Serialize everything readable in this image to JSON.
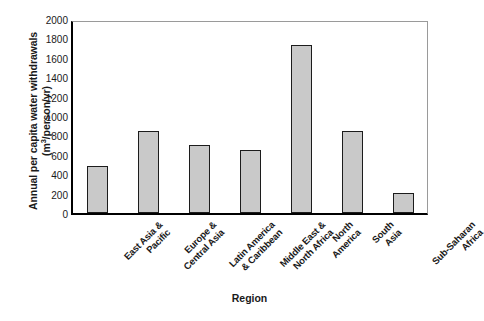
{
  "chart_data": {
    "type": "bar",
    "title": "",
    "xlabel": "Region",
    "ylabel": "Annual per capita water withdrawals (m³/person/yr)",
    "ylabel_line1": "Annual per capita water withdrawals",
    "ylabel_line2_prefix": "(m",
    "ylabel_line2_sup": "3",
    "ylabel_line2_suffix": "/person/yr)",
    "categories": [
      "East Asia & Pacific",
      "Europe & Central Asia",
      "Latin America & Caribbean",
      "Middle East & North Africa",
      "North America",
      "South Asia",
      "Sub-Saharan Africa"
    ],
    "category_lines": [
      [
        "East Asia &",
        "Pacific"
      ],
      [
        "Europe &",
        "Central Asia"
      ],
      [
        "Latin America",
        "& Caribbean"
      ],
      [
        "Middle East &",
        "North Africa"
      ],
      [
        "North",
        "America"
      ],
      [
        "South",
        "Asia"
      ],
      [
        "Sub-Saharan",
        "Africa"
      ]
    ],
    "values": [
      480,
      850,
      700,
      650,
      1730,
      845,
      210
    ],
    "ylim": [
      0,
      2000
    ],
    "yticks": [
      0,
      200,
      400,
      600,
      800,
      1000,
      1200,
      1400,
      1600,
      1800,
      2000
    ],
    "ytick_labels": [
      "0",
      "200",
      "400",
      "600",
      "800",
      "1000",
      "1200",
      "1400",
      "1600",
      "1800",
      "2000"
    ],
    "grid": false,
    "legend": null,
    "bar_fill_color": "#c9c9c9",
    "bar_edge_color": "#1c1c1c",
    "background_color": "#ffffff"
  }
}
